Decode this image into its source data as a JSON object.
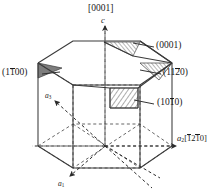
{
  "figure": {
    "background_color": "#ffffff",
    "line_color": "#3a3a3a",
    "text_color": "#1a1a1a",
    "hatch_color": "#555555",
    "shade_color": "#6e6e6e"
  },
  "labels": {
    "c_direction_index": "[0001]",
    "c_axis": "c",
    "basal_plane": {
      "open": "(",
      "digits": "0001",
      "close": ")",
      "full": "(0001)"
    },
    "plane_1120": {
      "pre": "(11",
      "bar": "2",
      "post": "0)",
      "full": "(1120)"
    },
    "plane_1100": {
      "pre": "(1",
      "bar": "1",
      "post": "00)",
      "full": "(1100)"
    },
    "plane_1010": {
      "pre": "(10",
      "bar": "1",
      "post": "0)",
      "full": "(1010)"
    },
    "axis_a1": {
      "symbol": "a",
      "subscript": "1",
      "full": "a1"
    },
    "axis_a2": {
      "symbol": "a",
      "subscript": "2",
      "bracket_open": "[",
      "bar1": "1",
      "mid": "2",
      "bar2": "1",
      "tail": "0",
      "bracket_close": "]",
      "full": "a2[1210]"
    },
    "axis_a3": {
      "symbol": "a",
      "subscript": "3",
      "full": "a3"
    }
  },
  "geometry": {
    "top_hexagon": [
      [
        38,
        63
      ],
      [
        73,
        41
      ],
      [
        140,
        41
      ],
      [
        172,
        63
      ],
      [
        140,
        85
      ],
      [
        73,
        85
      ]
    ],
    "mid_hexagon": [
      [
        38,
        108
      ],
      [
        73,
        86
      ],
      [
        140,
        86
      ],
      [
        172,
        108
      ],
      [
        140,
        130
      ],
      [
        73,
        130
      ]
    ],
    "bottom_hexagon": [
      [
        38,
        146
      ],
      [
        73,
        124
      ],
      [
        140,
        124
      ],
      [
        172,
        146
      ],
      [
        140,
        168
      ],
      [
        73,
        168
      ]
    ],
    "prism_height_px": 83,
    "center_point": [
      105,
      137
    ],
    "c_axis_arrow_tip": [
      105,
      23
    ],
    "a1_arrow_tip": [
      70,
      178
    ],
    "a2_arrow_tip": [
      178,
      137
    ],
    "a3_arrow_tip": [
      52,
      100
    ]
  },
  "leaders": {
    "basal": {
      "from": [
        155,
        47
      ],
      "to": [
        133,
        43
      ]
    },
    "p1120": {
      "from": [
        160,
        74
      ],
      "to": [
        140,
        70
      ]
    },
    "p1100": {
      "from": [
        44,
        75
      ],
      "to": [
        62,
        73
      ]
    },
    "p1010": {
      "from": [
        155,
        104
      ],
      "to": [
        135,
        100
      ]
    }
  }
}
